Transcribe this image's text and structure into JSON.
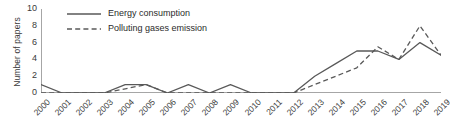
{
  "chart_data": {
    "type": "line",
    "title": "",
    "xlabel": "",
    "ylabel": "Number of papers",
    "ylim": [
      0,
      10
    ],
    "yticks": [
      0,
      2,
      4,
      6,
      8,
      10
    ],
    "grid": false,
    "legend_position": "top-left",
    "categories": [
      "2000",
      "2001",
      "2002",
      "2003",
      "2004",
      "2005",
      "2006",
      "2007",
      "2008",
      "2009",
      "2010",
      "2011",
      "2012",
      "2013",
      "2014",
      "2015",
      "2016",
      "2017",
      "2018",
      "2019"
    ],
    "series": [
      {
        "name": "Energy consumption",
        "style": "solid",
        "color": "#595959",
        "values": [
          1,
          0,
          0,
          0,
          1,
          1,
          0,
          1,
          0,
          1,
          0,
          0,
          0,
          2,
          3.5,
          5,
          5,
          4,
          6,
          4.5
        ]
      },
      {
        "name": "Polluting gases emission",
        "style": "dashed",
        "color": "#595959",
        "values": [
          0,
          0,
          0,
          0,
          0.5,
          1,
          0,
          0,
          0,
          0,
          0,
          0,
          0,
          1,
          2,
          3,
          5.5,
          4,
          8,
          4.5
        ]
      }
    ]
  },
  "axes": {
    "y_title": "Number of papers",
    "y_tick_labels": [
      "10",
      "8",
      "6",
      "4",
      "2",
      "0"
    ],
    "x_tick_labels": [
      "2000",
      "2001",
      "2002",
      "2003",
      "2004",
      "2005",
      "2006",
      "2007",
      "2008",
      "2009",
      "2010",
      "2011",
      "2012",
      "2013",
      "2014",
      "2015",
      "2016",
      "2017",
      "2018",
      "2019"
    ]
  },
  "legend": {
    "items": [
      {
        "label": "Energy consumption",
        "icon": "solid-line-icon"
      },
      {
        "label": "Polluting gases emission",
        "icon": "dashed-line-icon"
      }
    ]
  },
  "colors": {
    "line": "#595959",
    "axis": "#a6a6a6",
    "text": "#3a3a3a"
  }
}
